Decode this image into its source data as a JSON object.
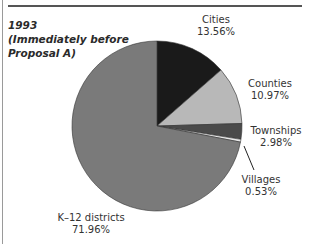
{
  "chart_data": {
    "type": "pie",
    "title": "1993",
    "subtitle": "(Immediately before Proposal A)",
    "categories": [
      "Cities",
      "Counties",
      "Townships",
      "Villages",
      "K–12 districts"
    ],
    "values": [
      13.56,
      10.97,
      2.98,
      0.53,
      71.96
    ],
    "unit": "%",
    "colors": [
      "#1a1a1a",
      "#b8b8b8",
      "#4a4a4a",
      "#e8e8e8",
      "#7a7a7a"
    ],
    "start_angle": "12 o'clock",
    "direction": "clockwise",
    "labels": [
      {
        "name": "Cities",
        "value": "13.56%"
      },
      {
        "name": "Counties",
        "value": "10.97%"
      },
      {
        "name": "Townships",
        "value": "2.98%"
      },
      {
        "name": "Villages",
        "value": "0.53%"
      },
      {
        "name": "K–12 districts",
        "value": "71.96%"
      }
    ]
  },
  "title": {
    "line1": "1993",
    "line2": "(Immediately before",
    "line3": "Proposal A)"
  }
}
